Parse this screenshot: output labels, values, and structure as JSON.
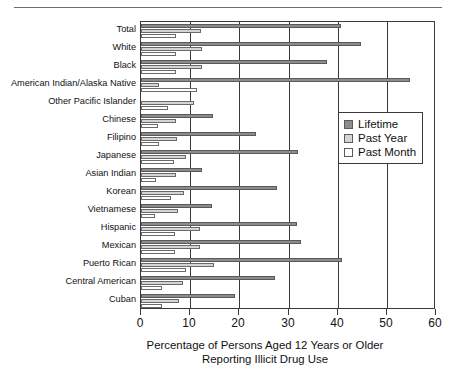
{
  "chart_data": {
    "type": "bar",
    "orientation": "horizontal",
    "title": "",
    "xlabel_line1": "Percentage of Persons Aged 12 Years or Older",
    "xlabel_line2": "Reporting Illicit Drug Use",
    "ylabel": "",
    "xlim": [
      0,
      60
    ],
    "xticks": [
      0,
      10,
      20,
      30,
      40,
      50,
      60
    ],
    "xtick_labels": [
      "0",
      "10",
      "20",
      "30",
      "40",
      "50",
      "60"
    ],
    "grid": true,
    "grid_axis": "x",
    "legend_position": "right",
    "categories": [
      "Total",
      "White",
      "Black",
      "American Indian/Alaska Native",
      "Other Pacific Islander",
      "Chinese",
      "Filipino",
      "Japanese",
      "Asian Indian",
      "Korean",
      "Vietnamese",
      "Hispanic",
      "Mexican",
      "Puerto Rican",
      "Central American",
      "Cuban"
    ],
    "series": [
      {
        "name": "Lifetime",
        "color": "#8c8c8c",
        "values": [
          40.6,
          44.7,
          37.8,
          54.7,
          0,
          14.6,
          23.4,
          31.9,
          12.4,
          27.7,
          14.4,
          31.7,
          32.5,
          40.8,
          27.2,
          19.1
        ]
      },
      {
        "name": "Past Year",
        "color": "#d4d4d4",
        "values": [
          12.2,
          12.4,
          12.5,
          3.7,
          10.8,
          7.1,
          7.4,
          9.1,
          7.2,
          8.8,
          7.5,
          11.9,
          11.9,
          14.8,
          8.6,
          7.8
        ]
      },
      {
        "name": "Past Month",
        "color": "#ffffff",
        "values": [
          7.1,
          7.1,
          7.2,
          11.4,
          5.5,
          3.4,
          3.6,
          6.8,
          3.1,
          6.2,
          2.8,
          6.9,
          6.9,
          9.2,
          4.2,
          4.3
        ]
      }
    ]
  },
  "legend": {
    "items": [
      {
        "label": "Lifetime",
        "swatch": "lifetime"
      },
      {
        "label": "Past Year",
        "swatch": "pastyear"
      },
      {
        "label": "Past Month",
        "swatch": "pastmonth"
      }
    ]
  }
}
